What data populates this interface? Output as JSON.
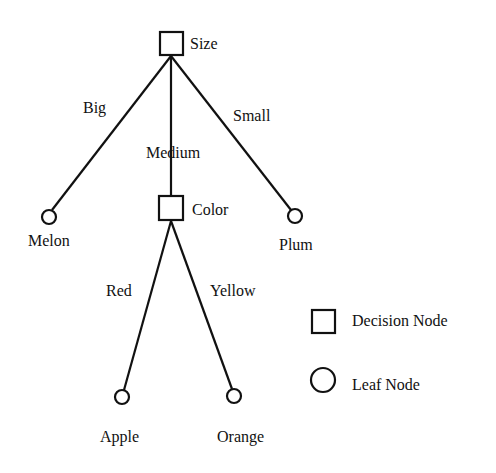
{
  "diagram": {
    "type": "decision-tree",
    "colors": {
      "ink": "#111111",
      "background": "#ffffff"
    },
    "nodes": {
      "size": {
        "label": "Size",
        "kind": "decision"
      },
      "color": {
        "label": "Color",
        "kind": "decision"
      },
      "melon": {
        "label": "Melon",
        "kind": "leaf"
      },
      "plum": {
        "label": "Plum",
        "kind": "leaf"
      },
      "apple": {
        "label": "Apple",
        "kind": "leaf"
      },
      "orange": {
        "label": "Orange",
        "kind": "leaf"
      }
    },
    "edges": {
      "size_melon": {
        "from": "size",
        "to": "melon",
        "label": "Big"
      },
      "size_color": {
        "from": "size",
        "to": "color",
        "label": "Medium"
      },
      "size_plum": {
        "from": "size",
        "to": "plum",
        "label": "Small"
      },
      "color_apple": {
        "from": "color",
        "to": "apple",
        "label": "Red"
      },
      "color_orange": {
        "from": "color",
        "to": "orange",
        "label": "Yellow"
      }
    },
    "legend": {
      "decision": {
        "label": "Decision Node",
        "icon": "square-icon"
      },
      "leaf": {
        "label": "Leaf Node",
        "icon": "circle-icon"
      }
    }
  }
}
